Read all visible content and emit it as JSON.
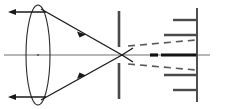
{
  "figure": {
    "background_color": "#ffffff",
    "width": 235,
    "height": 109,
    "side_label": "نور",
    "colors": {
      "ray": "#1a1a1a",
      "axis": "#6e6e6e",
      "lens": "#2a2a2a",
      "aperture": "#4a4a4a",
      "beam_dashed": "#5a5a5a",
      "beam_solid": "#121212",
      "comb": "#4a4a4a"
    }
  },
  "optical_axis": {
    "name": "optical-axis",
    "x1": 4,
    "y1": 55,
    "x2": 210,
    "y2": 55
  },
  "lens": {
    "name": "converging-lens",
    "center_x": 38,
    "center_y": 55,
    "radius_x": 12,
    "radius_y": 50
  },
  "incoming_rays": [
    {
      "name": "incoming-ray-top",
      "x1": 46,
      "y1": 12,
      "x2": 8,
      "y2": 12,
      "arrow_x": 12,
      "arrow_y": 12
    },
    {
      "name": "incoming-ray-bottom",
      "x1": 46,
      "y1": 97,
      "x2": 8,
      "y2": 97,
      "arrow_x": 12,
      "arrow_y": 97
    }
  ],
  "converging_rays": [
    {
      "name": "converging-ray-top",
      "x1": 41,
      "y1": 9,
      "x2": 122,
      "y2": 55,
      "arrow_x": 80,
      "arrow_y": 32
    },
    {
      "name": "converging-ray-bottom",
      "x1": 41,
      "y1": 100,
      "x2": 122,
      "y2": 55,
      "arrow_x": 80,
      "arrow_y": 78
    }
  ],
  "aperture": {
    "name": "pinhole-aperture",
    "x": 119,
    "top_bar": {
      "y1": 11,
      "y2": 47
    },
    "bottom_bar": {
      "y1": 63,
      "y2": 99
    },
    "gap_center_y": 55
  },
  "beams": {
    "dashed": [
      {
        "name": "diverging-beam-upper",
        "x1": 128,
        "y1": 46,
        "x2": 196,
        "y2": 40
      },
      {
        "name": "diverging-beam-lower",
        "x1": 128,
        "y1": 64,
        "x2": 196,
        "y2": 70
      }
    ],
    "solid_segment": {
      "name": "axis-beam-segment",
      "x1": 160,
      "y1": 55,
      "x2": 197,
      "y2": 55
    },
    "short_marker": {
      "name": "beam-marker-short",
      "x1": 150,
      "y1": 55,
      "x2": 158,
      "y2": 55
    }
  },
  "comb": {
    "name": "grating-comb",
    "spine": {
      "x": 197,
      "y1": 8,
      "y2": 102
    },
    "teeth": [
      {
        "name": "comb-tooth-1",
        "y": 20,
        "x_start": 173,
        "x_end": 197
      },
      {
        "name": "comb-tooth-2",
        "y": 35,
        "x_start": 164,
        "x_end": 197
      },
      {
        "name": "comb-tooth-3",
        "y": 75,
        "x_start": 164,
        "x_end": 197
      },
      {
        "name": "comb-tooth-4",
        "y": 90,
        "x_start": 173,
        "x_end": 197
      }
    ]
  }
}
